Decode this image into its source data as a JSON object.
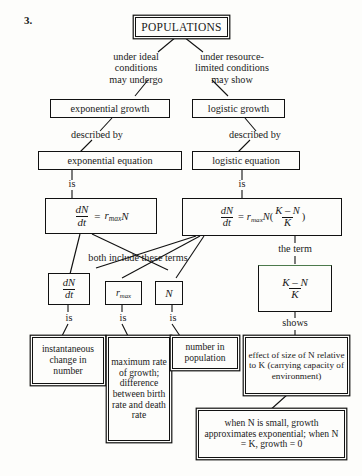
{
  "figure": {
    "number": "3.",
    "type": "concept-map",
    "topic": "Population growth concept map"
  },
  "nodes": {
    "populations": "POPULATIONS",
    "exponential_growth": "exponential growth",
    "logistic_growth": "logistic growth",
    "exponential_equation": "exponential equation",
    "logistic_equation": "logistic  equation",
    "exponential_formula": {
      "lhs_num": "dN",
      "lhs_den": "dt",
      "eq": "=",
      "rate": "r",
      "rate_sub": "max",
      "var": "N"
    },
    "logistic_formula": {
      "lhs_num": "dN",
      "lhs_den": "dt",
      "eq": "=",
      "rate": "r",
      "rate_sub": "max",
      "var": "N",
      "open": "(",
      "frac_num": "K – N",
      "frac_den": "K",
      "close": ")"
    },
    "term_dndt": {
      "num": "dN",
      "den": "dt"
    },
    "term_rmax": {
      "base": "r",
      "sub": "max"
    },
    "term_n": "N",
    "term_kmnk": {
      "num": "K – N",
      "den": "K"
    },
    "desc_dndt": "instantaneous\nchange in\nnumber",
    "desc_rmax": "maximum\nrate of\ngrowth;\ndifference\nbetween\nbirth rate\nand death\nrate",
    "desc_n": "number in\npopulation",
    "desc_kmnk": "effect of size of N\nrelative to K\n(carrying capacity\nof environment)",
    "desc_small_n": "when N is small, growth\napproximates exponential;\nwhen N = K, growth = 0"
  },
  "connector_labels": {
    "left_branch": "under ideal\nconditions\nmay undergo",
    "right_branch": "under resource-\nlimited conditions\nmay show",
    "described_by_left": "described by",
    "described_by_right": "described by",
    "is_left": "is",
    "is_right": "is",
    "both_include": "both include these terms",
    "the_term": "the term",
    "is_dndt": "is",
    "is_rmax": "is",
    "is_n": "is",
    "shows": "shows"
  },
  "colors": {
    "ink": "#111111",
    "paper": "#fdfdfb",
    "accent_green": "#4c7a4c"
  }
}
